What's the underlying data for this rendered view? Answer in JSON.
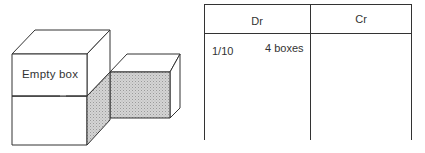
{
  "diagram": {
    "box_label": "Empty box",
    "colors": {
      "outline": "#333333",
      "shaded": "#cfcfcf",
      "face": "#ffffff"
    }
  },
  "ledger": {
    "columns": [
      {
        "label": "Dr"
      },
      {
        "label": "Cr"
      }
    ],
    "entries": [
      {
        "side": "Dr",
        "date": "1/10",
        "description": "4 boxes"
      }
    ]
  }
}
